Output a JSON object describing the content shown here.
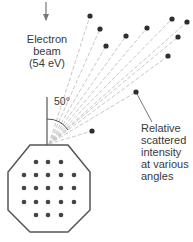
{
  "labels": {
    "beam_lines": [
      "Electron",
      "beam",
      "(54 eV)"
    ],
    "angle": "50°",
    "scatter_lines": [
      "Relative",
      "scattered",
      "intensity",
      "at various",
      "angles"
    ]
  },
  "colors": {
    "stroke": "#555555",
    "dot": "#2e2e2e",
    "ray": "#c8c8c8",
    "text": "#3a3a3a"
  },
  "geometry": {
    "ray_origin": [
      49,
      144
    ],
    "scatter_dots": [
      [
        90,
        16
      ],
      [
        100,
        29
      ],
      [
        106,
        46
      ],
      [
        126,
        36
      ],
      [
        147,
        28
      ],
      [
        172,
        19
      ],
      [
        187,
        22
      ],
      [
        178,
        37
      ],
      [
        168,
        56
      ],
      [
        136,
        92
      ],
      [
        92,
        131
      ]
    ],
    "crystal_dots": [
      [
        36,
        162
      ],
      [
        48,
        162
      ],
      [
        61,
        162
      ],
      [
        24,
        175
      ],
      [
        36,
        175
      ],
      [
        48,
        175
      ],
      [
        61,
        175
      ],
      [
        74,
        175
      ],
      [
        24,
        188
      ],
      [
        36,
        188
      ],
      [
        48,
        188
      ],
      [
        61,
        188
      ],
      [
        74,
        188
      ],
      [
        24,
        202
      ],
      [
        36,
        202
      ],
      [
        48,
        202
      ],
      [
        61,
        202
      ],
      [
        74,
        202
      ],
      [
        36,
        215
      ],
      [
        48,
        215
      ],
      [
        61,
        215
      ]
    ]
  }
}
